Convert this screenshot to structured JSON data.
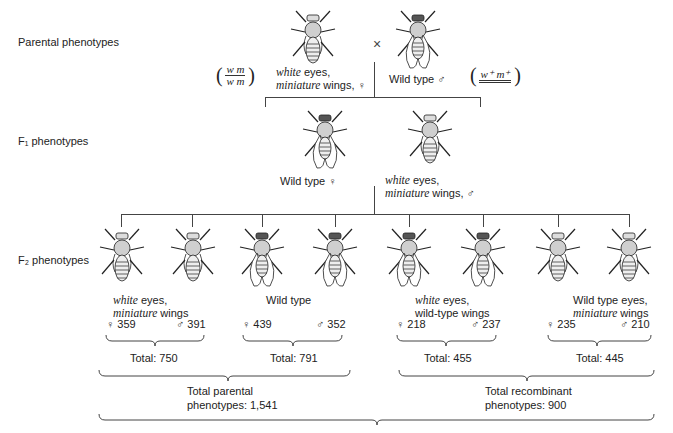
{
  "rows": {
    "parental": "Parental phenotypes",
    "f1": "F₁ phenotypes",
    "f2": "F₂ phenotypes"
  },
  "parental": {
    "female": {
      "italic1": "white",
      "text1": " eyes,",
      "italic2": "miniature",
      "text2": " wings, ♀"
    },
    "cross_symbol": "×",
    "male": {
      "text": "Wild type ♂"
    },
    "female_genotype": {
      "top": "w m",
      "bottom": "w m"
    },
    "male_genotype": {
      "top": "w⁺ m⁺",
      "arrow": "→"
    }
  },
  "f1": {
    "female": {
      "text": "Wild type ♀"
    },
    "male": {
      "italic1": "white",
      "text1": " eyes,",
      "italic2": "miniature",
      "text2": " wings, ♂"
    }
  },
  "f2": {
    "groups": [
      {
        "line1_italic": "white",
        "line1_text": " eyes,",
        "line2_italic": "miniature",
        "line2_text": " wings",
        "female": "♀ 359",
        "male": "♂ 391",
        "total": "Total: 750"
      },
      {
        "line1_italic": "",
        "line1_text": "Wild type",
        "line2_italic": "",
        "line2_text": "",
        "female": "♀ 439",
        "male": "♂ 352",
        "total": "Total: 791"
      },
      {
        "line1_italic": "white",
        "line1_text": " eyes,",
        "line2_italic": "",
        "line2_text": "wild-type wings",
        "female": "♀ 218",
        "male": "♂ 237",
        "total": "Total: 455"
      },
      {
        "line1_italic": "",
        "line1_text": "Wild type eyes,",
        "line2_italic": "miniature",
        "line2_text": " wings",
        "female": "♀ 235",
        "male": "♂ 210",
        "total": "Total: 445"
      }
    ],
    "parental_total": {
      "line1": "Total parental",
      "line2": "phenotypes: 1,541"
    },
    "recombinant_total": {
      "line1": "Total recombinant",
      "line2": "phenotypes: 900"
    }
  }
}
